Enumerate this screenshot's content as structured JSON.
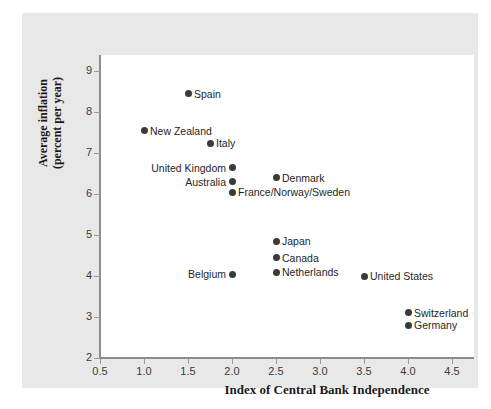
{
  "chart_data": {
    "type": "scatter",
    "title": "",
    "xlabel": "Index of Central Bank Independence",
    "ylabel": "Average inflation\n(percent per year)",
    "xlim": [
      0.5,
      4.75
    ],
    "ylim": [
      2,
      9.4
    ],
    "xticks": [
      "0.5",
      "1.0",
      "1.5",
      "2.0",
      "2.5",
      "3.0",
      "3.5",
      "4.0",
      "4.5"
    ],
    "xtick_values": [
      0.5,
      1.0,
      1.5,
      2.0,
      2.5,
      3.0,
      3.5,
      4.0,
      4.5
    ],
    "yticks": [
      "9",
      "8",
      "7",
      "6",
      "5",
      "4",
      "3",
      "2"
    ],
    "ytick_values": [
      9,
      8,
      7,
      6,
      5,
      4,
      3,
      2
    ],
    "grid": false,
    "legend": false,
    "marker_color": "#3a3a3a",
    "points": [
      {
        "label": "Spain",
        "x": 1.5,
        "y": 8.45,
        "label_side": "right"
      },
      {
        "label": "New Zealand",
        "x": 1.0,
        "y": 7.55,
        "label_side": "right"
      },
      {
        "label": "Italy",
        "x": 1.75,
        "y": 7.25,
        "label_side": "right"
      },
      {
        "label": "United Kingdom",
        "x": 2.0,
        "y": 6.65,
        "label_side": "left"
      },
      {
        "label": "Denmark",
        "x": 2.5,
        "y": 6.4,
        "label_side": "right"
      },
      {
        "label": "Australia",
        "x": 2.0,
        "y": 6.3,
        "label_side": "left"
      },
      {
        "label": "France/Norway/Sweden",
        "x": 2.0,
        "y": 6.05,
        "label_side": "right"
      },
      {
        "label": "Japan",
        "x": 2.5,
        "y": 4.85,
        "label_side": "right"
      },
      {
        "label": "Canada",
        "x": 2.5,
        "y": 4.45,
        "label_side": "right"
      },
      {
        "label": "Netherlands",
        "x": 2.5,
        "y": 4.1,
        "label_side": "right"
      },
      {
        "label": "Belgium",
        "x": 2.0,
        "y": 4.05,
        "label_side": "left"
      },
      {
        "label": "United States",
        "x": 3.5,
        "y": 4.0,
        "label_side": "right"
      },
      {
        "label": "Switzerland",
        "x": 4.0,
        "y": 3.1,
        "label_side": "right"
      },
      {
        "label": "Germany",
        "x": 4.0,
        "y": 2.8,
        "label_side": "right"
      }
    ]
  },
  "figure": {
    "background_color": "#e8e8e8",
    "plot_background_color": "#ffffff",
    "axis_color": "#8d8d8d"
  }
}
